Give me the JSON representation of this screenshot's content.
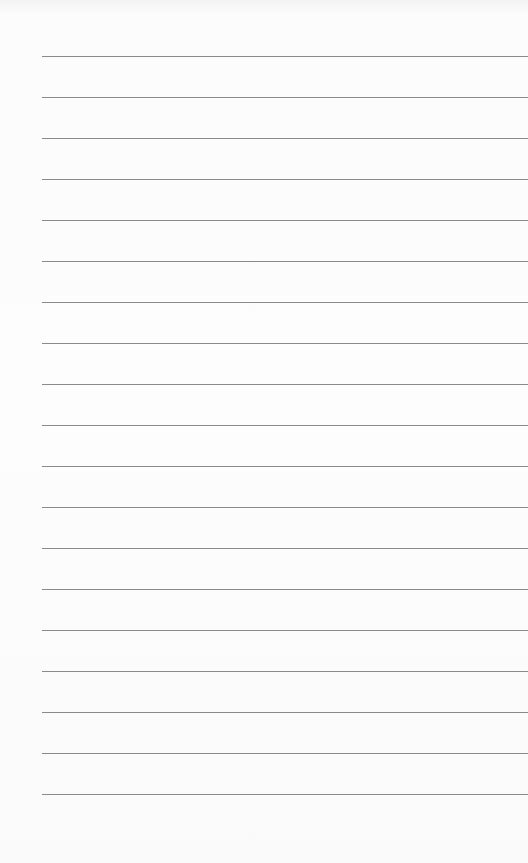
{
  "paper": {
    "type": "lined-notepad",
    "line_count": 19,
    "first_line_y": 56,
    "line_spacing": 41,
    "line_color": "#8a8a8a",
    "background_color": "#fbfbfb"
  }
}
